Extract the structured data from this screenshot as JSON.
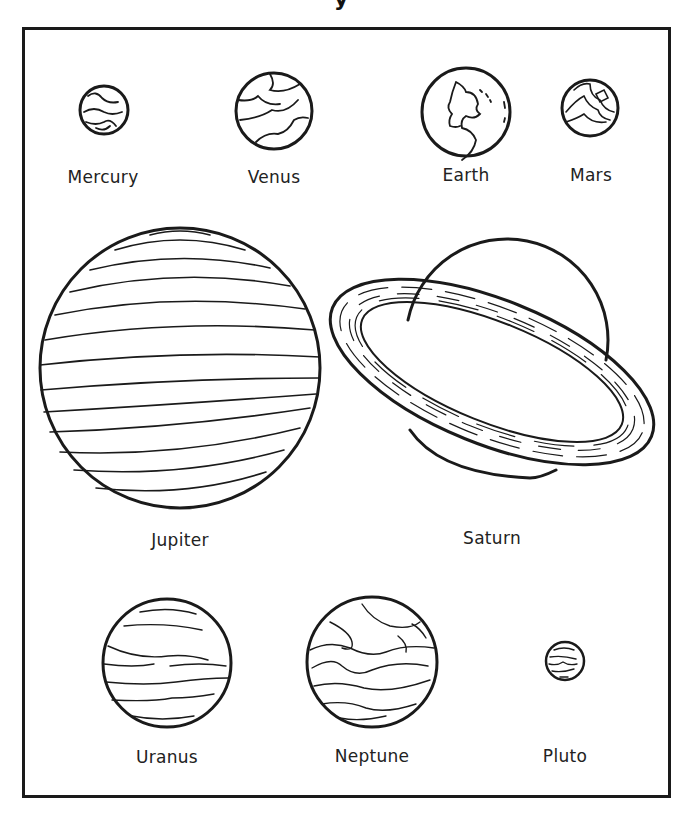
{
  "page": {
    "title_fragment": "y"
  },
  "planets": [
    {
      "id": "mercury",
      "label": "Mercury",
      "cx": 104,
      "cy": 110,
      "r": 24,
      "label_x": 103,
      "label_y": 167
    },
    {
      "id": "venus",
      "label": "Venus",
      "cx": 274,
      "cy": 111,
      "r": 38,
      "label_x": 274,
      "label_y": 167
    },
    {
      "id": "earth",
      "label": "Earth",
      "cx": 466,
      "cy": 112,
      "r": 44,
      "label_x": 466,
      "label_y": 165
    },
    {
      "id": "mars",
      "label": "Mars",
      "cx": 590,
      "cy": 108,
      "r": 28,
      "label_x": 591,
      "label_y": 165
    },
    {
      "id": "jupiter",
      "label": "Jupiter",
      "cx": 180,
      "cy": 368,
      "r": 140,
      "label_x": 180,
      "label_y": 530
    },
    {
      "id": "saturn",
      "label": "Saturn",
      "cx": 506,
      "cy": 355,
      "r": 100,
      "label_x": 492,
      "label_y": 528
    },
    {
      "id": "uranus",
      "label": "Uranus",
      "cx": 167,
      "cy": 663,
      "r": 64,
      "label_x": 167,
      "label_y": 747
    },
    {
      "id": "neptune",
      "label": "Neptune",
      "cx": 372,
      "cy": 662,
      "r": 65,
      "label_x": 372,
      "label_y": 746
    },
    {
      "id": "pluto",
      "label": "Pluto",
      "cx": 565,
      "cy": 661,
      "r": 19,
      "label_x": 565,
      "label_y": 746
    }
  ],
  "style": {
    "line_color": "#1a1a1a",
    "background": "#ffffff"
  }
}
